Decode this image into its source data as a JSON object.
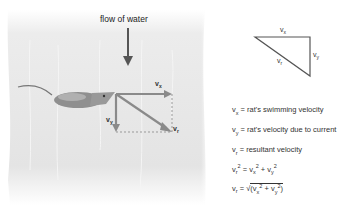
{
  "diagram": {
    "flow_label": "flow of water",
    "vector_labels": {
      "vx": "v",
      "vx_sub": "x",
      "vy": "v",
      "vy_sub": "y",
      "vr": "v",
      "vr_sub": "r"
    },
    "triangle_labels": {
      "top": "v",
      "top_sub": "x",
      "side": "v",
      "side_sub": "y",
      "hyp": "v",
      "hyp_sub": "r"
    },
    "legend": [
      {
        "sym": "v",
        "sub": "x",
        "text": " = rat's swimming velocity"
      },
      {
        "sym": "v",
        "sub": "y",
        "text": " = rat's velocity due to current"
      },
      {
        "sym": "v",
        "sub": "r",
        "text": " = resultant velocity"
      }
    ],
    "equation1": {
      "lhs": "v",
      "lhs_sub": "r",
      "text": " = v",
      "a_sub": "x",
      "plus": " + v",
      "b_sub": "y"
    },
    "equation2": {
      "lhs": "v",
      "lhs_sub": "r",
      "eq": " = ",
      "sqrt": "√",
      "open": "(v",
      "a_sub": "x",
      "plus": " + v",
      "b_sub": "y",
      "close": ")"
    },
    "colors": {
      "water": "#e6e6e6",
      "vector": "#8a8a8a",
      "arrow_flow": "#555555",
      "triangle": "#555555"
    }
  }
}
